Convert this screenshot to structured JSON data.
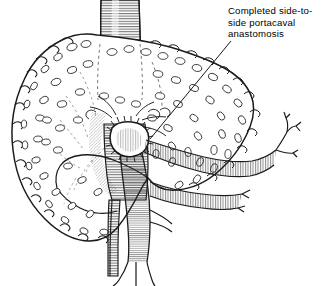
{
  "figure": {
    "type": "medical-line-illustration",
    "background_color": "#ffffff",
    "ink_color": "#1a1a1a",
    "width": 327,
    "height": 286
  },
  "annotations": [
    {
      "id": "anastomosis-label",
      "text": "Completed side-to-side portacaval anastomosis",
      "lines": [
        "Completed side-to-",
        "side portacaval",
        "anastomosis"
      ],
      "text_x": 228,
      "text_y": 5,
      "leader_from_x": 231,
      "leader_from_y": 41,
      "leader_to_x": 150,
      "leader_to_y": 139
    }
  ],
  "anatomy": {
    "liver": {
      "label": "cirrhotic liver",
      "surface": "nodular",
      "nodule_count": 68
    },
    "vessels": [
      {
        "name": "inferior-vena-cava",
        "orientation": "vertical",
        "shading": "hatched"
      },
      {
        "name": "portal-vein",
        "orientation": "vertical",
        "shading": "hatched"
      },
      {
        "name": "superior-mesenteric-vein",
        "orientation": "horizontal-right",
        "shading": "hatched"
      },
      {
        "name": "splenic-vein",
        "orientation": "horizontal-right",
        "shading": "hatched"
      },
      {
        "name": "iliac-veins",
        "orientation": "inferior-bifurcation",
        "shading": "line"
      }
    ],
    "anastomosis": {
      "name": "side-to-side portacaval anastomosis",
      "center_x": 128,
      "center_y": 145,
      "suture_line": true
    }
  }
}
